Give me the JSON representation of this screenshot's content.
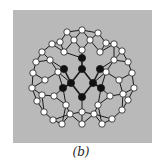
{
  "figure": {
    "caption": "(b)",
    "colors": {
      "background_panel": "#b9b9b9",
      "bond": "#1a1a1a",
      "white_atom": "#ffffff",
      "dark_atom": "#111111",
      "page": "#ffffff"
    },
    "atoms": {
      "white": [
        [
          67,
          32
        ],
        [
          82,
          30
        ],
        [
          98,
          33
        ],
        [
          60,
          42
        ],
        [
          74,
          40
        ],
        [
          90,
          40
        ],
        [
          106,
          43
        ],
        [
          52,
          44
        ],
        [
          114,
          44
        ],
        [
          42,
          52
        ],
        [
          122,
          51
        ],
        [
          36,
          62
        ],
        [
          128,
          62
        ],
        [
          33,
          73
        ],
        [
          132,
          73
        ],
        [
          32,
          88
        ],
        [
          134,
          88
        ],
        [
          37,
          101
        ],
        [
          128,
          100
        ],
        [
          44,
          112
        ],
        [
          122,
          110
        ],
        [
          53,
          120
        ],
        [
          112,
          119
        ],
        [
          62,
          124
        ],
        [
          102,
          124
        ],
        [
          82,
          124
        ],
        [
          50,
          60
        ],
        [
          64,
          52
        ],
        [
          82,
          50
        ],
        [
          100,
          52
        ],
        [
          114,
          60
        ],
        [
          45,
          80
        ],
        [
          119,
          80
        ],
        [
          54,
          96
        ],
        [
          110,
          96
        ],
        [
          66,
          105
        ],
        [
          98,
          105
        ],
        [
          82,
          112
        ],
        [
          42,
          95
        ],
        [
          123,
          94
        ],
        [
          58,
          72
        ],
        [
          106,
          72
        ],
        [
          70,
          114
        ],
        [
          94,
          114
        ]
      ],
      "dark": [
        [
          82,
          58
        ],
        [
          82,
          69
        ],
        [
          64,
          69
        ],
        [
          100,
          69
        ],
        [
          71,
          83
        ],
        [
          93,
          83
        ],
        [
          63,
          88
        ],
        [
          101,
          88
        ],
        [
          82,
          97
        ]
      ]
    }
  }
}
